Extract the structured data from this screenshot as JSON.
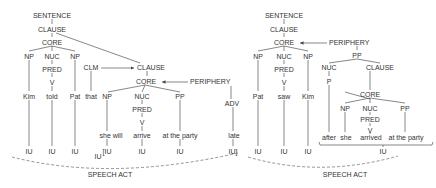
{
  "left_tree": {
    "sentence": "SENTENCE",
    "clause": "CLAUSE",
    "core": "CORE",
    "np1": "NP",
    "nuc": "NUC",
    "np2": "NP",
    "pred": "PRED",
    "v": "V",
    "clm": "CLM",
    "clause2": "CLAUSE",
    "core2": "CORE",
    "periphery": "PERIPHERY",
    "np3": "NP",
    "nuc2": "NUC",
    "pp": "PP",
    "adv": "ADV",
    "pred2": "PRED",
    "v2": "V",
    "words": {
      "kim": "Kim",
      "told": "told",
      "pat": "Pat",
      "that": "that",
      "she_will": "she will",
      "arrive": "arrive",
      "at_the_party": "at the party",
      "late": "late"
    },
    "iu": {
      "iu1": "IU",
      "iu2": "IU",
      "iu3": "IU",
      "iu4": "[IU",
      "iu5": "IU",
      "iu6": "IU",
      "iu7": "IU]",
      "iu_low": "IU"
    },
    "speech_act": "SPEECH ACT"
  },
  "right_tree": {
    "sentence": "SENTENCE",
    "clause": "CLAUSE",
    "core": "CORE",
    "periphery": "PERIPHERY",
    "np1": "NP",
    "nuc": "NUC",
    "np2": "NP",
    "pp": "PP",
    "pred": "PRED",
    "v": "V",
    "nuc_p": "NUC",
    "p": "P",
    "clause2": "CLAUSE",
    "core2": "CORE",
    "np3": "NP",
    "nuc2": "NUC",
    "pp2": "PP",
    "pred2": "PRED",
    "v2": "V",
    "words": {
      "pat": "Pat",
      "saw": "saw",
      "kim": "Kim",
      "after": "after",
      "she": "she",
      "arrived": "arrived",
      "at_the_party": "at the party"
    },
    "iu": {
      "iu1": "IU",
      "iu2": "IU",
      "iu3": "IU",
      "iu4": "IU"
    },
    "speech_act": "SPEECH ACT"
  }
}
